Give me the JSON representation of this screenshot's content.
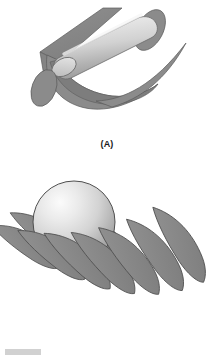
{
  "figure": {
    "background_color": "#ffffff",
    "width_px": 214,
    "height_px": 360
  },
  "palette": {
    "sheet_gray": "#8a8a8a",
    "sheet_gray_dark": "#6f6f6f",
    "sheet_gray_light": "#9a9a9a",
    "outline": "#4a4a4a",
    "body_highlight": "#ededed",
    "body_midtone": "#c9c9c9",
    "body_shadow": "#9d9d9d",
    "label_color": "#1a1a1a",
    "artifact_gray": "#c9c9c9"
  },
  "panels": [
    {
      "id": "panel-a",
      "label": "(A)",
      "icon_name": "cylinder-wrapped-by-sheet-icon",
      "description": "Shaded cylindrical rod lying diagonally, partially enclosed by a curved gray sheet, with elliptical discs at the lower-left and upper-right ends",
      "elements": [
        {
          "name": "back-flat-sheet",
          "shape": "parallelogram-sheet",
          "fill": "#8a8a8a"
        },
        {
          "name": "upper-right-ellipse",
          "shape": "ellipse",
          "fill": "#8a8a8a"
        },
        {
          "name": "curved-wrapping-sheet",
          "shape": "curved-blade",
          "fill": "#8a8a8a"
        },
        {
          "name": "central-cylinder",
          "shape": "cylinder",
          "fill": "gradient #ededed to #9d9d9d"
        },
        {
          "name": "lower-left-ellipse",
          "shape": "ellipse",
          "fill": "#8a8a8a"
        },
        {
          "name": "tapered-tail-sheet",
          "shape": "tapered-blade",
          "fill": "#8a8a8a"
        }
      ]
    },
    {
      "id": "panel-b",
      "label": "(B)",
      "icon_name": "sphere-with-blade-fan-icon",
      "description": "Shaded sphere resting on a fanned array of nine overlapping crescent-shaped gray blades",
      "elements": [
        {
          "name": "blade-fan",
          "shape": "crescent-array",
          "count": 9,
          "fill": "#8a8a8a"
        },
        {
          "name": "central-sphere",
          "shape": "sphere",
          "fill": "radial gradient #f2f2f2 to #9d9d9d"
        }
      ],
      "blade_count": 9
    }
  ],
  "artifact": {
    "name": "scan-edge-artifact",
    "visible": true
  }
}
